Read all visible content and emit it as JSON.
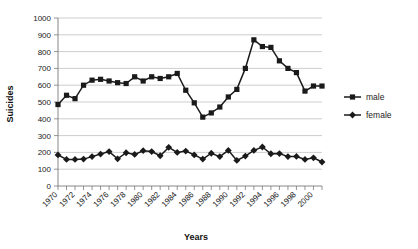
{
  "chart_data": {
    "type": "line",
    "title": "",
    "xlabel": "Years",
    "ylabel": "Suicides",
    "ylim": [
      0,
      1000
    ],
    "ytick_step": 100,
    "yticks": [
      0,
      100,
      200,
      300,
      400,
      500,
      600,
      700,
      800,
      900,
      1000
    ],
    "xlim": [
      1970,
      2001
    ],
    "x": [
      1970,
      1971,
      1972,
      1973,
      1974,
      1975,
      1976,
      1977,
      1978,
      1979,
      1980,
      1981,
      1982,
      1983,
      1984,
      1985,
      1986,
      1987,
      1988,
      1989,
      1990,
      1991,
      1992,
      1993,
      1994,
      1995,
      1996,
      1997,
      1998,
      1999,
      2000,
      2001
    ],
    "xtick_labels": [
      "1970",
      "1972",
      "1974",
      "1976",
      "1978",
      "1980",
      "1982",
      "1984",
      "1986",
      "1988",
      "1990",
      "1992",
      "1994",
      "1996",
      "1998",
      "2000"
    ],
    "xtick_label_step": 2,
    "grid": true,
    "grid_axis": "y",
    "legend_position": "right",
    "series": [
      {
        "name": "male",
        "marker": "square",
        "color": "#1a1a1a",
        "values": [
          485,
          540,
          520,
          600,
          630,
          635,
          625,
          615,
          610,
          650,
          625,
          650,
          640,
          650,
          670,
          570,
          495,
          410,
          435,
          470,
          530,
          575,
          700,
          870,
          830,
          825,
          745,
          700,
          675,
          565,
          595,
          595
        ]
      },
      {
        "name": "female",
        "marker": "diamond",
        "color": "#1a1a1a",
        "values": [
          185,
          158,
          158,
          160,
          175,
          190,
          205,
          162,
          198,
          188,
          210,
          205,
          180,
          230,
          200,
          208,
          185,
          160,
          195,
          175,
          212,
          152,
          178,
          212,
          232,
          192,
          193,
          175,
          176,
          158,
          168,
          143
        ]
      }
    ]
  },
  "legend": {
    "items": [
      {
        "label": "male"
      },
      {
        "label": "female"
      }
    ]
  },
  "axes": {
    "y_title": "Suicides",
    "x_title": "Years"
  }
}
